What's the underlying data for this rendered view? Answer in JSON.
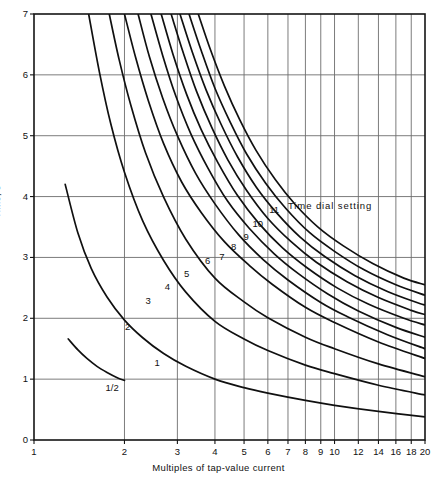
{
  "chart_data": {
    "type": "line",
    "title": "",
    "xlabel": "Multiples of tap-value current",
    "ylabel": "Time, s",
    "xscale": "log",
    "yscale": "linear",
    "xlim": [
      1,
      20
    ],
    "ylim": [
      0,
      7
    ],
    "grid": true,
    "legend_position": "inline-curve-labels",
    "annotations": [
      {
        "text": "Time dial setting",
        "x": 7.0,
        "y": 4.35
      }
    ],
    "xticks": [
      1,
      2,
      3,
      4,
      5,
      6,
      7,
      8,
      9,
      10,
      12,
      14,
      16,
      18,
      20
    ],
    "xtick_labels": [
      "1",
      "2",
      "3",
      "4",
      "5",
      "6",
      "7",
      "8",
      "9",
      "10",
      "12",
      "14",
      "16",
      "18",
      "20"
    ],
    "yticks": [
      0,
      1,
      2,
      3,
      4,
      5,
      6,
      7
    ],
    "ytick_labels": [
      "0",
      "1",
      "2",
      "3",
      "4",
      "5",
      "6",
      "7"
    ],
    "series": [
      {
        "name": "1/2",
        "label": "1/2",
        "label_x": 1.82,
        "label_y": 0.86,
        "x": [
          1.3,
          1.4,
          1.5,
          1.62,
          1.75,
          1.9,
          2.0
        ],
        "y": [
          1.66,
          1.48,
          1.34,
          1.21,
          1.11,
          1.02,
          0.98
        ]
      },
      {
        "name": "1",
        "label": "1",
        "label_x": 2.57,
        "label_y": 1.26,
        "x": [
          1.27,
          1.4,
          1.55,
          1.75,
          2.0,
          2.3,
          2.7,
          3.2,
          4.0,
          5.0,
          6.0,
          8.0,
          10.0,
          14.0,
          20.0
        ],
        "y": [
          4.2,
          3.4,
          2.82,
          2.35,
          1.97,
          1.68,
          1.42,
          1.21,
          1.0,
          0.86,
          0.77,
          0.65,
          0.57,
          0.47,
          0.38
        ]
      },
      {
        "name": "2",
        "label": "2",
        "label_x": 2.05,
        "label_y": 1.86,
        "x": [
          1.52,
          1.65,
          1.8,
          2.0,
          2.3,
          2.7,
          3.2,
          4.0,
          5.0,
          6.0,
          8.0,
          10.0,
          14.0,
          20.0
        ],
        "y": [
          7.0,
          6.05,
          5.2,
          4.4,
          3.6,
          2.95,
          2.43,
          1.95,
          1.66,
          1.47,
          1.23,
          1.09,
          0.9,
          0.74
        ]
      },
      {
        "name": "3",
        "label": "3",
        "label_x": 2.4,
        "label_y": 2.28,
        "x": [
          1.78,
          1.92,
          2.1,
          2.35,
          2.7,
          3.2,
          4.0,
          5.0,
          6.0,
          8.0,
          10.0,
          14.0,
          20.0
        ],
        "y": [
          7.0,
          6.25,
          5.5,
          4.72,
          3.99,
          3.3,
          2.66,
          2.27,
          2.01,
          1.69,
          1.5,
          1.25,
          1.04
        ]
      },
      {
        "name": "4",
        "label": "4",
        "label_x": 2.78,
        "label_y": 2.52,
        "x": [
          2.0,
          2.18,
          2.4,
          2.7,
          3.1,
          3.6,
          4.3,
          5.2,
          6.2,
          8.0,
          10.0,
          14.0,
          20.0
        ],
        "y": [
          7.0,
          6.28,
          5.58,
          4.87,
          4.24,
          3.74,
          3.26,
          2.87,
          2.56,
          2.18,
          1.93,
          1.61,
          1.34
        ]
      },
      {
        "name": "5",
        "label": "5",
        "label_x": 3.22,
        "label_y": 2.73,
        "x": [
          2.22,
          2.42,
          2.68,
          3.0,
          3.45,
          4.0,
          4.8,
          5.8,
          7.0,
          9.0,
          11.0,
          15.0,
          20.0
        ],
        "y": [
          7.0,
          6.3,
          5.62,
          5.0,
          4.38,
          3.88,
          3.37,
          2.96,
          2.63,
          2.26,
          2.03,
          1.73,
          1.5
        ]
      },
      {
        "name": "6",
        "label": "6",
        "label_x": 3.78,
        "label_y": 2.94,
        "x": [
          2.45,
          2.68,
          2.96,
          3.32,
          3.8,
          4.4,
          5.2,
          6.3,
          7.6,
          9.5,
          12.0,
          16.0,
          20.0
        ],
        "y": [
          7.0,
          6.32,
          5.66,
          5.04,
          4.46,
          3.93,
          3.48,
          3.06,
          2.73,
          2.4,
          2.12,
          1.85,
          1.69
        ]
      },
      {
        "name": "7",
        "label": "7",
        "label_x": 4.22,
        "label_y": 3.0,
        "x": [
          2.65,
          2.9,
          3.22,
          3.6,
          4.1,
          4.75,
          5.6,
          6.7,
          8.1,
          10.2,
          13.0,
          17.0,
          20.0
        ],
        "y": [
          7.0,
          6.34,
          5.68,
          5.1,
          4.55,
          4.02,
          3.56,
          3.16,
          2.83,
          2.5,
          2.23,
          2.0,
          1.89
        ]
      },
      {
        "name": "8",
        "label": "8",
        "label_x": 4.62,
        "label_y": 3.17,
        "x": [
          2.86,
          3.14,
          3.48,
          3.9,
          4.42,
          5.1,
          6.0,
          7.2,
          8.7,
          11.0,
          14.0,
          18.0,
          20.0
        ],
        "y": [
          7.0,
          6.36,
          5.72,
          5.14,
          4.6,
          4.1,
          3.64,
          3.25,
          2.92,
          2.6,
          2.34,
          2.13,
          2.06
        ]
      },
      {
        "name": "9",
        "label": "9",
        "label_x": 5.08,
        "label_y": 3.33,
        "x": [
          3.06,
          3.36,
          3.74,
          4.2,
          4.76,
          5.5,
          6.45,
          7.7,
          9.3,
          11.7,
          15.0,
          19.0,
          20.0
        ],
        "y": [
          7.0,
          6.38,
          5.75,
          5.18,
          4.65,
          4.15,
          3.72,
          3.33,
          3.01,
          2.7,
          2.44,
          2.25,
          2.22
        ]
      },
      {
        "name": "10",
        "label": "10",
        "label_x": 5.55,
        "label_y": 3.55,
        "x": [
          3.28,
          3.6,
          4.0,
          4.5,
          5.1,
          5.9,
          6.9,
          8.25,
          10.0,
          12.5,
          16.0,
          20.0
        ],
        "y": [
          7.0,
          6.4,
          5.78,
          5.22,
          4.7,
          4.22,
          3.8,
          3.41,
          3.1,
          2.8,
          2.55,
          2.38
        ]
      },
      {
        "name": "11",
        "label": "11",
        "label_x": 6.3,
        "label_y": 3.78,
        "x": [
          3.52,
          3.86,
          4.3,
          4.84,
          5.48,
          6.35,
          7.4,
          8.85,
          10.7,
          13.4,
          17.0,
          20.0
        ],
        "y": [
          7.0,
          6.42,
          5.82,
          5.26,
          4.76,
          4.28,
          3.87,
          3.49,
          3.19,
          2.9,
          2.66,
          2.55
        ]
      }
    ]
  },
  "figure": {
    "background": "#ffffff",
    "axis_color": "#141414",
    "grid_color": "#6d6d6d",
    "curve_color": "#101010"
  }
}
